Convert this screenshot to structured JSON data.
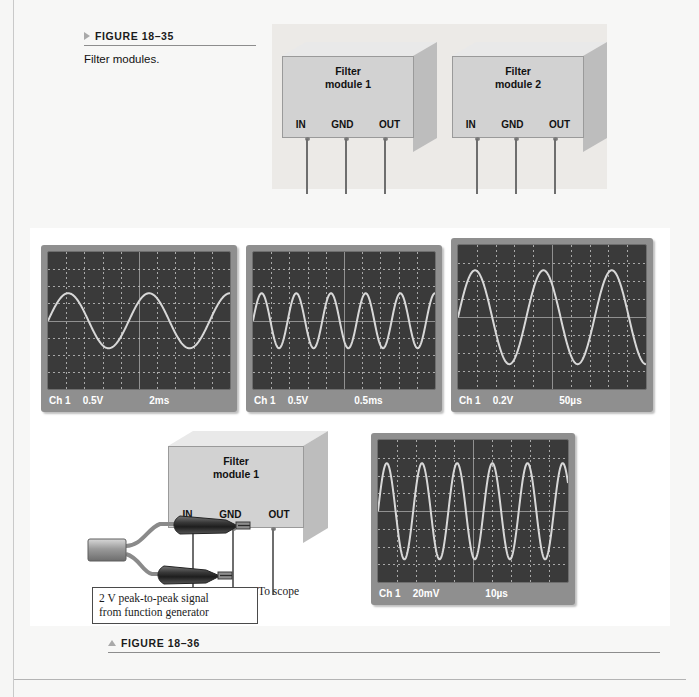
{
  "figure_35": {
    "marker": "triangle-right",
    "label": "FIGURE 18–35",
    "caption": "Filter modules.",
    "modules": [
      {
        "title_line1": "Filter",
        "title_line2": "module 1",
        "pins": [
          "IN",
          "GND",
          "OUT"
        ]
      },
      {
        "title_line1": "Filter",
        "title_line2": "module 2",
        "pins": [
          "IN",
          "GND",
          "OUT"
        ]
      }
    ]
  },
  "figure_36": {
    "marker": "triangle-up",
    "label": "FIGURE 18–36",
    "module": {
      "title_line1": "Filter",
      "title_line2": "module 1",
      "pins": [
        "IN",
        "GND",
        "OUT"
      ]
    },
    "note_box_line1": "2 V peak-to-peak signal",
    "note_box_line2": "from function generator",
    "to_scope_label": "To scope",
    "scopes": [
      {
        "id": "scope-1",
        "channel": "Ch 1",
        "volts_per_div": "0.5V",
        "time_per_div": "2ms",
        "cycles": 2.25,
        "amplitude_divs": 1.6,
        "phase": 0.0
      },
      {
        "id": "scope-2",
        "channel": "Ch 1",
        "volts_per_div": "0.5V",
        "time_per_div": "0.5ms",
        "cycles": 5.25,
        "amplitude_divs": 1.6,
        "phase": 0.0
      },
      {
        "id": "scope-3",
        "channel": "Ch 1",
        "volts_per_div": "0.2V",
        "time_per_div": "50µs",
        "cycles": 2.75,
        "amplitude_divs": 2.6,
        "phase": 0.0
      },
      {
        "id": "scope-4",
        "channel": "Ch 1",
        "volts_per_div": "20mV",
        "time_per_div": "10µs",
        "cycles": 5.4,
        "amplitude_divs": 2.7,
        "phase": 0.0
      }
    ]
  },
  "chart_data": [
    {
      "type": "line",
      "title": "Scope 1 — input / low attenuation",
      "xlabel": "Time (2 ms/div)",
      "ylabel": "Amplitude (0.5 V/div)",
      "legend": [
        "Ch 1"
      ],
      "grid": true,
      "x_divisions": 10,
      "y_divisions": 8,
      "waveform": "sine",
      "cycles": 2.25,
      "amplitude_divs": 1.6
    },
    {
      "type": "line",
      "title": "Scope 2 — 0.5 ms/div",
      "xlabel": "Time (0.5 ms/div)",
      "ylabel": "Amplitude (0.5 V/div)",
      "legend": [
        "Ch 1"
      ],
      "grid": true,
      "x_divisions": 10,
      "y_divisions": 8,
      "waveform": "sine",
      "cycles": 5.25,
      "amplitude_divs": 1.6
    },
    {
      "type": "line",
      "title": "Scope 3 — 50 µs/div",
      "xlabel": "Time (50 µs/div)",
      "ylabel": "Amplitude (0.2 V/div)",
      "legend": [
        "Ch 1"
      ],
      "grid": true,
      "x_divisions": 10,
      "y_divisions": 8,
      "waveform": "sine",
      "cycles": 2.75,
      "amplitude_divs": 2.6
    },
    {
      "type": "line",
      "title": "Scope 4 — 10 µs/div",
      "xlabel": "Time (10 µs/div)",
      "ylabel": "Amplitude (20 mV/div)",
      "legend": [
        "Ch 1"
      ],
      "grid": true,
      "x_divisions": 10,
      "y_divisions": 8,
      "waveform": "sine",
      "cycles": 5.4,
      "amplitude_divs": 2.7
    }
  ],
  "colors": {
    "page_bg": "#f7f7f6",
    "panel35_bg": "#eceae7",
    "scope_body": "#8f8f8f",
    "scope_screen": "#3a3a3a",
    "trace": "#d8d8d8",
    "module_front": "#d2d2d2",
    "module_top": "#e9e9e9",
    "module_side": "#bdbdbd",
    "rule": "#8d8d8d"
  }
}
